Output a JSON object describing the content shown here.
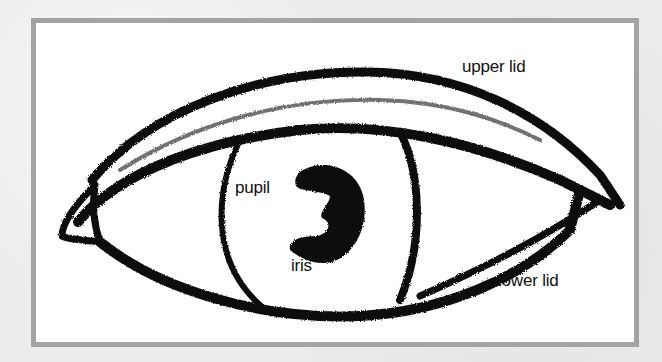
{
  "diagram": {
    "labels": {
      "upper_lid": "upper lid",
      "pupil": "pupil",
      "iris": "iris",
      "lower_lid": "lower lid"
    }
  },
  "colors": {
    "background": "#eeeeee",
    "frame_border": "#a3a3a3",
    "canvas": "#ffffff",
    "ink": "#111111"
  }
}
